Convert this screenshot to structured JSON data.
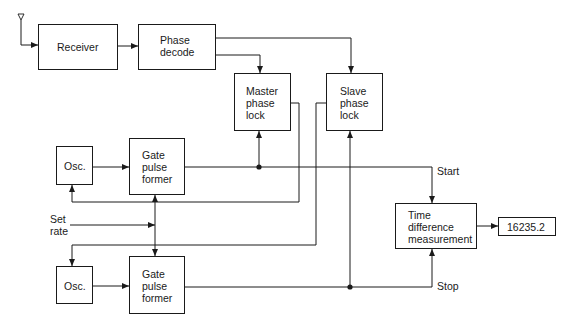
{
  "diagram": {
    "blocks": {
      "receiver": "Receiver",
      "phase_decode": "Phase\ndecode",
      "master_phase_lock": "Master\nphase\nlock",
      "slave_phase_lock": "Slave\nphase\nlock",
      "osc_upper": "Osc.",
      "gate_upper": "Gate\npulse\nformer",
      "osc_lower": "Osc.",
      "gate_lower": "Gate\npulse\nformer",
      "time_difference": "Time\ndifference\nmeasurement",
      "readout": "16235.2"
    },
    "labels": {
      "set_rate": "Set\nrate",
      "start": "Start",
      "stop": "Stop"
    },
    "icons": {
      "antenna": "antenna-icon"
    },
    "colors": {
      "line": "#1a1a1a",
      "background": "#ffffff"
    }
  }
}
